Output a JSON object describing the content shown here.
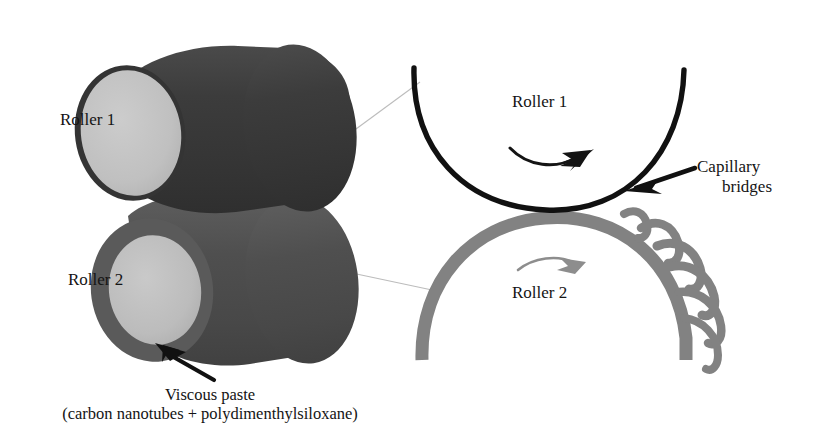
{
  "figure": {
    "type": "diagram",
    "background_color": "#ffffff"
  },
  "left_panel": {
    "name": "three-dimensional roller pair",
    "roller1": {
      "label": "Roller 1",
      "body_color": "#3a3a3a",
      "cap_color": "#bfbfbf",
      "cap_edge_color": "#3a3a3a"
    },
    "roller2": {
      "label": "Roller 2",
      "body_color": "#4f4f4f",
      "cap_color": "#bdbdbd",
      "cap_edge_color": "#5a5a5a"
    },
    "callout": {
      "arrow_name": "viscous-paste-arrow",
      "arrow_color": "#111111",
      "line1": "Viscous paste",
      "line2": "(carbon nanotubes + polydimenthylsiloxane)"
    },
    "leader_lines": {
      "color": "#b9b9b9",
      "count": 2
    }
  },
  "right_panel": {
    "name": "magnified nip region",
    "roller1": {
      "label": "Roller 1",
      "arc_color": "#111111",
      "rotation_arrow": "clockwise-arrow",
      "rotation_arrow_color": "#141414"
    },
    "roller2": {
      "label": "Roller 2",
      "arc_color": "#828282",
      "rotation_arrow": "clockwise-arrow",
      "rotation_arrow_color": "#8a8a8a"
    },
    "capillary_bridges": {
      "label_line1": "Capillary",
      "label_line2": "bridges",
      "color": "#828282",
      "count": 6,
      "pointer_arrow": "capillary-bridges-arrow",
      "pointer_arrow_color": "#111111"
    }
  }
}
